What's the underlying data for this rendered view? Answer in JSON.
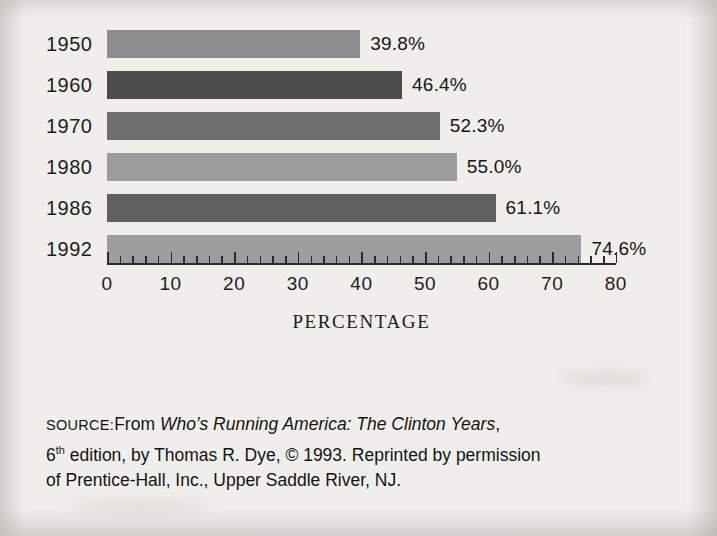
{
  "figure": {
    "axis_title": "PERCENTAGE",
    "source_prefix": "SOURCE:",
    "source_line1_a": "From ",
    "source_line1_italic": "Who’s Running America: The Clinton Years",
    "source_line1_b": ",",
    "source_line2_a": "6",
    "source_line2_sup": "th",
    "source_line2_b": " edition, by Thomas R. Dye, © 1993. Reprinted by permission",
    "source_line3": "of Prentice-Hall, Inc., Upper Saddle River, NJ."
  },
  "colors": {
    "background": "#efeeea",
    "axis": "#2b2b2b",
    "text": "#1d1d1d",
    "bar_1950": "#8d8d8d",
    "bar_1960": "#4c4c4c",
    "bar_1970": "#6f6f6f",
    "bar_1980": "#9c9c9c",
    "bar_1986": "#606060",
    "bar_1992": "#9d9d9d"
  },
  "chart_data": {
    "type": "bar",
    "orientation": "horizontal",
    "title": "",
    "xlabel": "PERCENTAGE",
    "ylabel": "",
    "categories": [
      "1950",
      "1960",
      "1970",
      "1980",
      "1986",
      "1992"
    ],
    "values": [
      39.8,
      46.4,
      52.3,
      55.0,
      61.1,
      74.6
    ],
    "value_labels": [
      "39.8%",
      "46.4%",
      "52.3%",
      "55.0%",
      "61.1%",
      "74.6%"
    ],
    "bar_colors": [
      "#8d8d8d",
      "#4c4c4c",
      "#6f6f6f",
      "#9c9c9c",
      "#606060",
      "#9d9d9d"
    ],
    "xlim": [
      0,
      80
    ],
    "major_ticks": [
      0,
      10,
      20,
      30,
      40,
      50,
      60,
      70,
      80
    ],
    "major_tick_labels": [
      "0",
      "10",
      "20",
      "30",
      "40",
      "50",
      "60",
      "70",
      "80"
    ],
    "minor_tick_step": 2,
    "grid": false,
    "legend": "none"
  }
}
